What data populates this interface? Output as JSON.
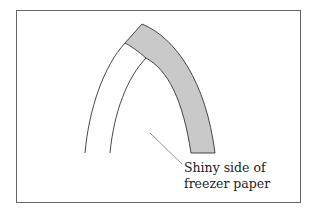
{
  "diagram": {
    "type": "illustration",
    "colors": {
      "background": "#ffffff",
      "border": "#555555",
      "band_fill": "#c9c9c9",
      "stroke": "#333333",
      "leader": "#777777"
    },
    "callout": {
      "line1": "Shiny side of",
      "line2": "freezer paper"
    }
  }
}
